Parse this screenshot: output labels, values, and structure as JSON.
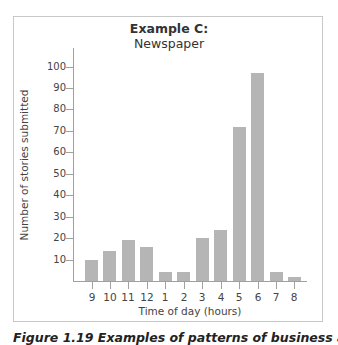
{
  "title": {
    "line1": "Example C:",
    "line2": "Newspaper"
  },
  "axes": {
    "xlabel": "Time of day (hours)",
    "ylabel": "Number of stories submitted"
  },
  "caption": "Figure 1.19 Examples of patterns of business activity",
  "colors": {
    "bar": "#b5b5b5",
    "axis": "#a0a0a0",
    "frame": "#c8c8c8"
  },
  "chart_data": {
    "type": "bar",
    "title": "Example C: Newspaper",
    "xlabel": "Time of day (hours)",
    "ylabel": "Number of stories submitted",
    "categories": [
      "9",
      "10",
      "11",
      "12",
      "1",
      "2",
      "3",
      "4",
      "5",
      "6",
      "7",
      "8"
    ],
    "values": [
      10,
      14,
      19,
      16,
      4,
      4,
      20,
      24,
      72,
      97,
      4,
      2
    ],
    "yticks": [
      10,
      20,
      30,
      40,
      50,
      60,
      70,
      80,
      90,
      100
    ],
    "ylim": [
      0,
      100
    ],
    "grid": false,
    "legend": null
  }
}
